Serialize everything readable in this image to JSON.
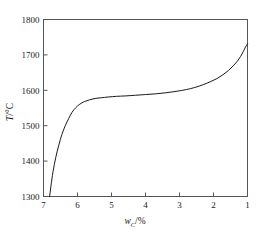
{
  "chart_data": {
    "type": "line",
    "title": "",
    "xlabel": "w_C/%",
    "ylabel": "T/°C",
    "xlabel_main": "w",
    "xlabel_sub": "C",
    "xlabel_unit": "/%",
    "ylabel_main": "T",
    "ylabel_unit": "/°C",
    "grid": false,
    "legend": null,
    "xlim": [
      7,
      1
    ],
    "ylim": [
      1300,
      1800
    ],
    "x_reversed": true,
    "xticks": [
      7,
      6,
      5,
      4,
      3,
      2,
      1
    ],
    "xtick_labels": [
      "7",
      "6",
      "5",
      "4",
      "3",
      "2",
      "1"
    ],
    "yticks": [
      1300,
      1400,
      1500,
      1600,
      1700,
      1800
    ],
    "ytick_labels": [
      "1300",
      "1400",
      "1500",
      "1600",
      "1700",
      "1800"
    ],
    "line_color": "#1a1a1a",
    "line_width": 1.0,
    "frame_color": "#555555",
    "background": "#ffffff",
    "series": [
      {
        "name": "liquidus",
        "x": [
          6.82,
          6.78,
          6.72,
          6.64,
          6.55,
          6.46,
          6.36,
          6.26,
          6.16,
          6.05,
          5.93,
          5.8,
          5.65,
          5.48,
          5.3,
          5.1,
          4.85,
          4.6,
          4.3,
          4.0,
          3.7,
          3.4,
          3.1,
          2.8,
          2.55,
          2.3,
          2.1,
          1.9,
          1.72,
          1.56,
          1.42,
          1.3,
          1.2,
          1.12,
          1.06,
          1.0
        ],
        "y": [
          1300,
          1330,
          1370,
          1410,
          1445,
          1475,
          1500,
          1520,
          1538,
          1551,
          1561,
          1568,
          1573,
          1577,
          1579,
          1581,
          1583,
          1584,
          1586,
          1588,
          1590,
          1593,
          1597,
          1602,
          1608,
          1616,
          1624,
          1633,
          1644,
          1656,
          1669,
          1682,
          1696,
          1710,
          1722,
          1731
        ]
      }
    ]
  }
}
